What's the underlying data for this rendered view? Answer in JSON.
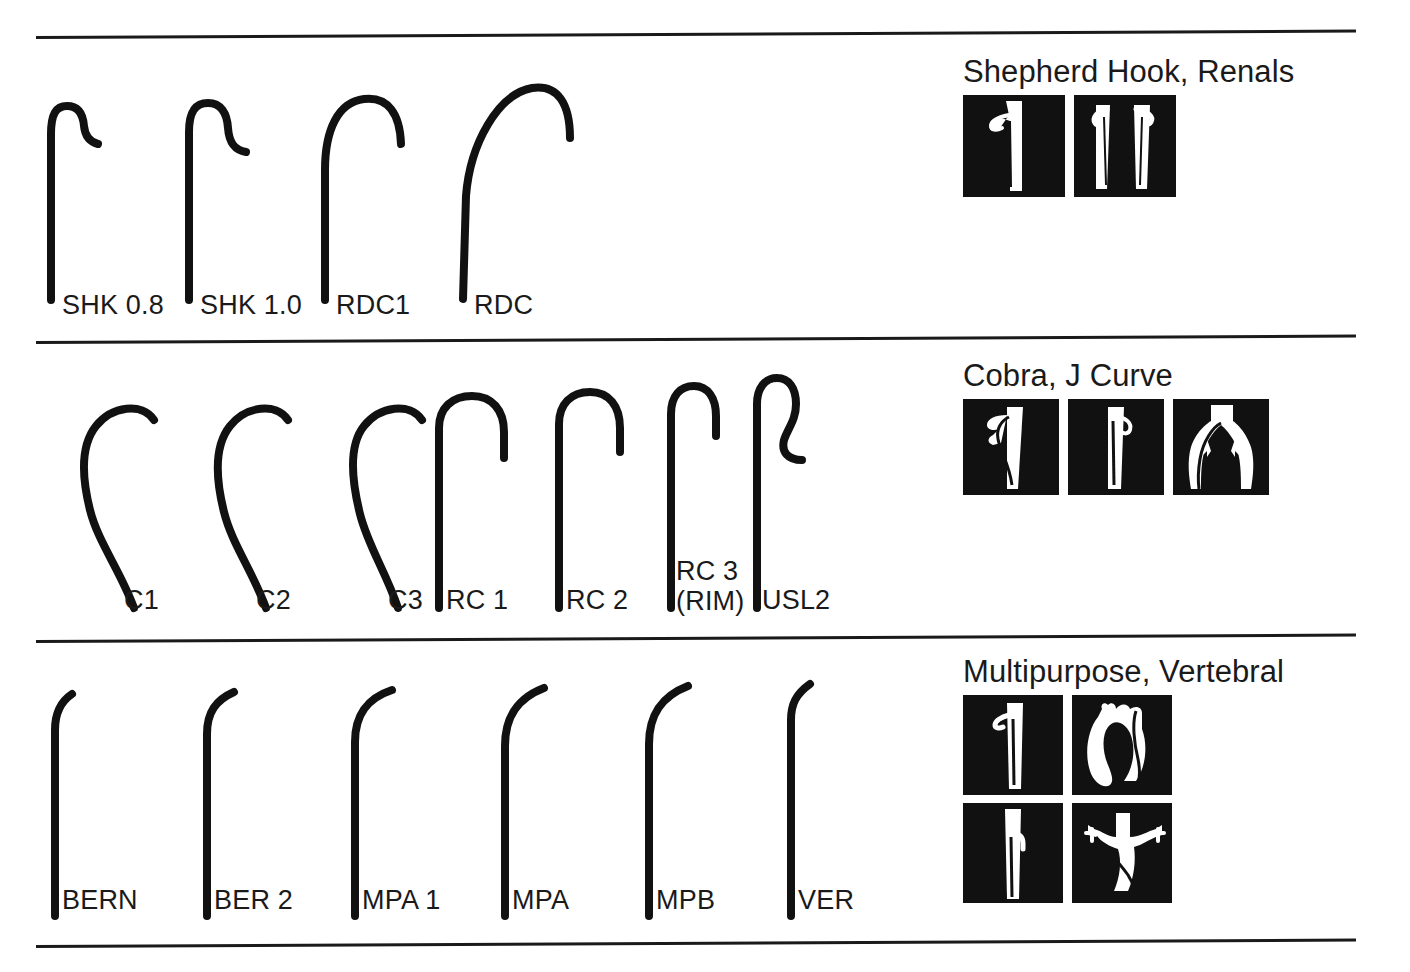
{
  "figure": {
    "kind": "catheter-shape-reference-chart",
    "background_color": "#ffffff",
    "ink_color": "#111111"
  },
  "rules": [
    {
      "name": "rule-top",
      "y": 36
    },
    {
      "name": "rule-row1-row2",
      "y": 341
    },
    {
      "name": "rule-row2-row3",
      "y": 640
    },
    {
      "name": "rule-bottom",
      "y": 945
    }
  ],
  "rows": [
    {
      "id": "row-shepherd-hook-renals",
      "panel": {
        "title": "Shepherd Hook, Renals",
        "thumbnails": [
          {
            "name": "thumb-renal-catheter-in-aorta",
            "art": "renal-hook-in-vessel"
          },
          {
            "name": "thumb-renal-catheter-bilateral",
            "art": "renal-double-vessel"
          }
        ]
      },
      "catheters": [
        {
          "label": "SHK 0.8",
          "art": "shepherd-hook-small"
        },
        {
          "label": "SHK 1.0",
          "art": "shepherd-hook-large"
        },
        {
          "label": "RDC1",
          "art": "rdc1-arc"
        },
        {
          "label": "RDC",
          "art": "rdc-wide-arc"
        }
      ]
    },
    {
      "id": "row-cobra-j-curve",
      "panel": {
        "title": "Cobra, J Curve",
        "thumbnails": [
          {
            "name": "thumb-cobra-in-renal-artery",
            "art": "cobra-in-vessel"
          },
          {
            "name": "thumb-j-curve-in-vessel",
            "art": "jcurve-in-vessel"
          },
          {
            "name": "thumb-aortic-bifurcation",
            "art": "aortic-bifurcation"
          }
        ]
      },
      "catheters": [
        {
          "label": "C1",
          "art": "cobra-1"
        },
        {
          "label": "C2",
          "art": "cobra-2"
        },
        {
          "label": "C3",
          "art": "cobra-3"
        },
        {
          "label": "RC 1",
          "art": "rc-1-j"
        },
        {
          "label": "RC 2",
          "art": "rc-2-j"
        },
        {
          "label": "RC 3\n(RIM)",
          "art": "rc-3-rim"
        },
        {
          "label": "USL2",
          "art": "usl2-sigmoid"
        }
      ]
    },
    {
      "id": "row-multipurpose-vertebral",
      "panel": {
        "title": "Multipurpose, Vertebral",
        "thumbnails": [
          {
            "name": "thumb-multipurpose-in-vessel",
            "art": "mp-in-vessel"
          },
          {
            "name": "thumb-aortic-arch",
            "art": "aortic-arch"
          },
          {
            "name": "thumb-vertebral-in-vessel",
            "art": "vert-in-vessel"
          },
          {
            "name": "thumb-arch-branch-vessels",
            "art": "arch-branches"
          }
        ]
      },
      "catheters": [
        {
          "label": "BERN",
          "art": "bern-angle-slight"
        },
        {
          "label": "BER 2",
          "art": "ber2-angle"
        },
        {
          "label": "MPA 1",
          "art": "mpa1-angle"
        },
        {
          "label": "MPA",
          "art": "mpa-angle"
        },
        {
          "label": "MPB",
          "art": "mpb-angle"
        },
        {
          "label": "VER",
          "art": "ver-angle"
        }
      ]
    }
  ]
}
